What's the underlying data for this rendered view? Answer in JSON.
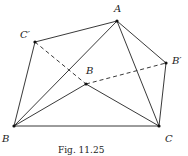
{
  "figure": {
    "caption": "Fig. 11.25",
    "points": {
      "A": {
        "label": "A",
        "x": 117,
        "y": 21
      },
      "Bp": {
        "label": "B′",
        "x": 166,
        "y": 63
      },
      "Cp": {
        "label": "C′",
        "x": 35,
        "y": 42
      },
      "Bi": {
        "label": "B",
        "x": 86,
        "y": 84
      },
      "B": {
        "label": "B",
        "x": 14,
        "y": 126
      },
      "C": {
        "label": "C",
        "x": 159,
        "y": 126
      }
    },
    "solid_segments": [
      [
        "Cp",
        "A"
      ],
      [
        "A",
        "Bp"
      ],
      [
        "Bp",
        "C"
      ],
      [
        "C",
        "B"
      ],
      [
        "B",
        "Cp"
      ],
      [
        "B",
        "A"
      ],
      [
        "A",
        "C"
      ],
      [
        "B",
        "Bi"
      ],
      [
        "Bi",
        "C"
      ]
    ],
    "dashed_segments": [
      [
        "Cp",
        "Bi"
      ],
      [
        "Bi",
        "Bp"
      ]
    ]
  }
}
